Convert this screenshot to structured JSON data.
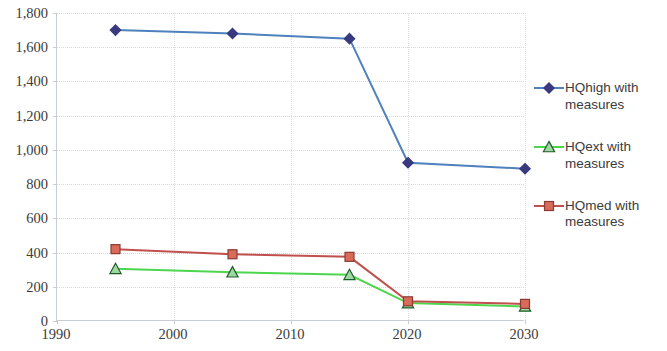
{
  "chart_data": {
    "type": "line",
    "title": "",
    "subtitle": "",
    "xlabel": "",
    "ylabel": "",
    "x": [
      1995,
      2005,
      2015,
      2020,
      2030
    ],
    "xlim": [
      1990,
      2030
    ],
    "ylim": [
      0,
      1800
    ],
    "grid": true,
    "legend_position": "right",
    "x_ticks": [
      "1990",
      "2000",
      "2010",
      "2020",
      "2030"
    ],
    "x_tick_values": [
      1990,
      2000,
      2010,
      2020,
      2030
    ],
    "y_ticks": [
      "0",
      "200",
      "400",
      "600",
      "800",
      "1,000",
      "1,200",
      "1,400",
      "1,600",
      "1,800"
    ],
    "y_tick_values": [
      0,
      200,
      400,
      600,
      800,
      1000,
      1200,
      1400,
      1600,
      1800
    ],
    "series": [
      {
        "name": "HQhigh with measures",
        "color": "#4f81bd",
        "marker": "diamond",
        "marker_color": "#39397f",
        "values": [
          1700,
          1680,
          1650,
          925,
          890
        ]
      },
      {
        "name": "HQext with measures",
        "color": "#4dd64d",
        "marker": "triangle",
        "marker_color": "#9bd9a0",
        "values": [
          305,
          285,
          270,
          105,
          85
        ]
      },
      {
        "name": "HQmed with measures",
        "color": "#c0504d",
        "marker": "square",
        "marker_color": "#d86b5a",
        "values": [
          420,
          390,
          375,
          115,
          100
        ]
      }
    ]
  },
  "legend": {
    "items": [
      {
        "label": "HQhigh with measures",
        "icon": "diamond-marker-icon"
      },
      {
        "label": "HQext with measures",
        "icon": "triangle-marker-icon"
      },
      {
        "label": "HQmed with measures",
        "icon": "square-marker-icon"
      }
    ]
  },
  "axes": {
    "y_labels": [
      "1,800",
      "1,600",
      "1,400",
      "1,200",
      "1,000",
      "800",
      "600",
      "400",
      "200",
      "0"
    ],
    "x_labels": [
      "1990",
      "2000",
      "2010",
      "2020",
      "2030"
    ]
  }
}
